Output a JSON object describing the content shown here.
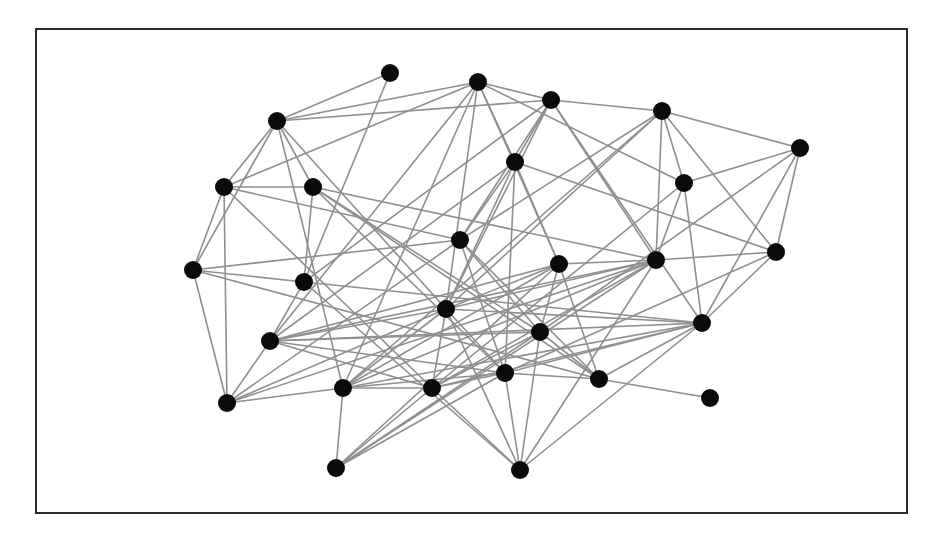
{
  "diagram": {
    "type": "network-graph",
    "frame": {
      "x": 35,
      "y": 28,
      "width": 873,
      "height": 486,
      "border_color": "#2a2a2a"
    },
    "edge_color": "#8f8f8f",
    "node_color": "#0a0a0a",
    "node_radius": 9,
    "nodes": [
      {
        "id": "A",
        "x": 277,
        "y": 121
      },
      {
        "id": "B",
        "x": 224,
        "y": 187
      },
      {
        "id": "C",
        "x": 313,
        "y": 187
      },
      {
        "id": "D",
        "x": 390,
        "y": 73
      },
      {
        "id": "E",
        "x": 478,
        "y": 82
      },
      {
        "id": "F",
        "x": 551,
        "y": 100
      },
      {
        "id": "G",
        "x": 515,
        "y": 162
      },
      {
        "id": "H",
        "x": 460,
        "y": 240
      },
      {
        "id": "I",
        "x": 662,
        "y": 111
      },
      {
        "id": "J",
        "x": 684,
        "y": 183
      },
      {
        "id": "K",
        "x": 800,
        "y": 148
      },
      {
        "id": "L",
        "x": 656,
        "y": 260
      },
      {
        "id": "M",
        "x": 776,
        "y": 252
      },
      {
        "id": "N",
        "x": 193,
        "y": 270
      },
      {
        "id": "O",
        "x": 304,
        "y": 282
      },
      {
        "id": "P",
        "x": 270,
        "y": 341
      },
      {
        "id": "Q",
        "x": 227,
        "y": 403
      },
      {
        "id": "R",
        "x": 343,
        "y": 388
      },
      {
        "id": "S",
        "x": 446,
        "y": 309
      },
      {
        "id": "T",
        "x": 540,
        "y": 332
      },
      {
        "id": "U",
        "x": 505,
        "y": 373
      },
      {
        "id": "V",
        "x": 432,
        "y": 388
      },
      {
        "id": "W",
        "x": 599,
        "y": 379
      },
      {
        "id": "X",
        "x": 520,
        "y": 470
      },
      {
        "id": "Y",
        "x": 559,
        "y": 264
      },
      {
        "id": "Z",
        "x": 702,
        "y": 323
      },
      {
        "id": "AA",
        "x": 710,
        "y": 398
      },
      {
        "id": "BB",
        "x": 336,
        "y": 468
      }
    ],
    "edges": [
      [
        "A",
        "D"
      ],
      [
        "A",
        "E"
      ],
      [
        "A",
        "F"
      ],
      [
        "A",
        "B"
      ],
      [
        "A",
        "C"
      ],
      [
        "A",
        "N"
      ],
      [
        "A",
        "R"
      ],
      [
        "A",
        "S"
      ],
      [
        "D",
        "O"
      ],
      [
        "E",
        "F"
      ],
      [
        "E",
        "G"
      ],
      [
        "E",
        "J"
      ],
      [
        "E",
        "B"
      ],
      [
        "E",
        "P"
      ],
      [
        "E",
        "S"
      ],
      [
        "E",
        "Y"
      ],
      [
        "E",
        "R"
      ],
      [
        "F",
        "I"
      ],
      [
        "F",
        "G"
      ],
      [
        "F",
        "H"
      ],
      [
        "F",
        "O"
      ],
      [
        "F",
        "S"
      ],
      [
        "F",
        "Z"
      ],
      [
        "F",
        "L"
      ],
      [
        "B",
        "C"
      ],
      [
        "B",
        "N"
      ],
      [
        "B",
        "Q"
      ],
      [
        "B",
        "H"
      ],
      [
        "B",
        "V"
      ],
      [
        "C",
        "L"
      ],
      [
        "C",
        "O"
      ],
      [
        "C",
        "U"
      ],
      [
        "C",
        "W"
      ],
      [
        "C",
        "T"
      ],
      [
        "G",
        "H"
      ],
      [
        "G",
        "Y"
      ],
      [
        "G",
        "S"
      ],
      [
        "G",
        "P"
      ],
      [
        "G",
        "U"
      ],
      [
        "G",
        "M"
      ],
      [
        "H",
        "N"
      ],
      [
        "H",
        "T"
      ],
      [
        "H",
        "U"
      ],
      [
        "H",
        "Q"
      ],
      [
        "H",
        "I"
      ],
      [
        "H",
        "W"
      ],
      [
        "I",
        "J"
      ],
      [
        "I",
        "K"
      ],
      [
        "I",
        "L"
      ],
      [
        "I",
        "M"
      ],
      [
        "I",
        "S"
      ],
      [
        "I",
        "R"
      ],
      [
        "J",
        "K"
      ],
      [
        "J",
        "Z"
      ],
      [
        "J",
        "L"
      ],
      [
        "J",
        "V"
      ],
      [
        "K",
        "M"
      ],
      [
        "K",
        "Z"
      ],
      [
        "K",
        "T"
      ],
      [
        "L",
        "Y"
      ],
      [
        "L",
        "M"
      ],
      [
        "L",
        "S"
      ],
      [
        "L",
        "P"
      ],
      [
        "L",
        "X"
      ],
      [
        "L",
        "V"
      ],
      [
        "L",
        "R"
      ],
      [
        "M",
        "Z"
      ],
      [
        "M",
        "U"
      ],
      [
        "N",
        "Q"
      ],
      [
        "N",
        "O"
      ],
      [
        "N",
        "W"
      ],
      [
        "O",
        "P"
      ],
      [
        "O",
        "X"
      ],
      [
        "O",
        "Z"
      ],
      [
        "P",
        "Q"
      ],
      [
        "P",
        "S"
      ],
      [
        "P",
        "T"
      ],
      [
        "P",
        "U"
      ],
      [
        "P",
        "V"
      ],
      [
        "P",
        "Y"
      ],
      [
        "P",
        "Z"
      ],
      [
        "Q",
        "R"
      ],
      [
        "Q",
        "S"
      ],
      [
        "Q",
        "L"
      ],
      [
        "R",
        "V"
      ],
      [
        "R",
        "BB"
      ],
      [
        "R",
        "Y"
      ],
      [
        "R",
        "U"
      ],
      [
        "R",
        "S"
      ],
      [
        "R",
        "Z"
      ],
      [
        "S",
        "V"
      ],
      [
        "S",
        "X"
      ],
      [
        "S",
        "Y"
      ],
      [
        "S",
        "U"
      ],
      [
        "S",
        "Z"
      ],
      [
        "T",
        "Y"
      ],
      [
        "T",
        "X"
      ],
      [
        "T",
        "BB"
      ],
      [
        "T",
        "W"
      ],
      [
        "T",
        "V"
      ],
      [
        "U",
        "V"
      ],
      [
        "U",
        "W"
      ],
      [
        "U",
        "X"
      ],
      [
        "U",
        "BB"
      ],
      [
        "U",
        "Z"
      ],
      [
        "V",
        "BB"
      ],
      [
        "V",
        "X"
      ],
      [
        "V",
        "Z"
      ],
      [
        "W",
        "AA"
      ],
      [
        "W",
        "Y"
      ],
      [
        "W",
        "Z"
      ],
      [
        "X",
        "Z"
      ],
      [
        "BB",
        "Y"
      ],
      [
        "BB",
        "L"
      ]
    ]
  }
}
